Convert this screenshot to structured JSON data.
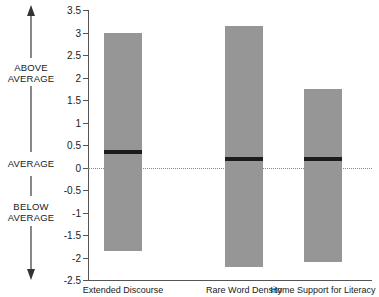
{
  "chart_data": {
    "type": "bar",
    "title": "",
    "xlabel": "",
    "ylabel": "",
    "ylim": [
      -2.5,
      3.5
    ],
    "grid": false,
    "legend": null,
    "yticks": [
      "3.5",
      "3",
      "2.5",
      "2",
      "1.5",
      "1",
      "0.5",
      "0",
      "-0.5",
      "-1",
      "-1.5",
      "-2",
      "-2.5"
    ],
    "ytick_values": [
      3.5,
      3,
      2.5,
      2,
      1.5,
      1,
      0.5,
      0,
      -0.5,
      -1,
      -1.5,
      -2,
      -2.5
    ],
    "reference_line": 0,
    "categories": [
      "Extended Discourse",
      "Rare Word Density",
      "Home Support for Literacy"
    ],
    "series": [
      {
        "name": "range-high",
        "values": [
          3.0,
          3.15,
          1.75
        ]
      },
      {
        "name": "range-low",
        "values": [
          -1.85,
          -2.2,
          -2.1
        ]
      },
      {
        "name": "median",
        "values": [
          0.35,
          0.2,
          0.2
        ]
      }
    ],
    "bars": [
      {
        "category": "Extended Discourse",
        "high": 3.0,
        "low": -1.85,
        "median": 0.35
      },
      {
        "category": "Rare Word Density",
        "high": 3.15,
        "low": -2.2,
        "median": 0.2
      },
      {
        "category": "Home Support for Literacy",
        "high": 1.75,
        "low": -2.1,
        "median": 0.2
      }
    ]
  },
  "annotations": {
    "above_average": "ABOVE\nAVERAGE",
    "above_average_line1": "ABOVE",
    "above_average_line2": "AVERAGE",
    "average": "AVERAGE",
    "below_average_line1": "BELOW",
    "below_average_line2": "AVERAGE",
    "arrow_up": "arrow-up",
    "arrow_down": "arrow-down"
  },
  "colors": {
    "bar_fill": "#969696",
    "median_line": "#1c1c1c",
    "axis": "#555555",
    "zero_line": "#8a8a8a",
    "text": "#1a1a1a",
    "background": "#ffffff"
  }
}
